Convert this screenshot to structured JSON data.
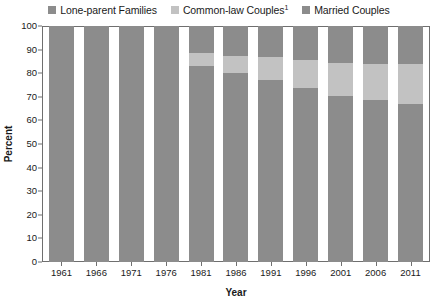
{
  "chart_data": {
    "type": "bar",
    "stacked": true,
    "title": "",
    "xlabel": "Year",
    "ylabel": "Percent",
    "ylim": [
      0,
      100
    ],
    "ytick_step": 10,
    "yticks": [
      "100",
      "90",
      "80",
      "70",
      "60",
      "50",
      "40",
      "30",
      "20",
      "10",
      "0"
    ],
    "grid": false,
    "legend_position": "top-center",
    "categories": [
      "1961",
      "1966",
      "1971",
      "1976",
      "1981",
      "1986",
      "1991",
      "1996",
      "2001",
      "2006",
      "2011"
    ],
    "series": [
      {
        "name": "Lone-parent Families",
        "color": "#8c8c8c",
        "values": [
          8.4,
          8.4,
          8.4,
          9.4,
          11.3,
          12.7,
          13.0,
          14.5,
          15.7,
          15.9,
          16.3
        ]
      },
      {
        "name": "Common-law Couples",
        "footnote": "1",
        "color": "#c2c2c2",
        "values": [
          0.0,
          0.0,
          0.0,
          0.0,
          5.6,
          7.2,
          9.9,
          11.8,
          13.8,
          15.5,
          16.7
        ]
      },
      {
        "name": "Married Couples",
        "color": "#8c8c8c",
        "values": [
          91.6,
          91.6,
          91.6,
          90.6,
          83.1,
          80.1,
          77.1,
          73.7,
          70.5,
          68.6,
          67.0
        ]
      }
    ]
  },
  "legend": {
    "items": [
      {
        "label": "Lone-parent Families",
        "footnote": "",
        "color": "#8c8c8c",
        "swatch_name": "legend-swatch-lone-parent"
      },
      {
        "label": "Common-law Couples",
        "footnote": "1",
        "color": "#c2c2c2",
        "swatch_name": "legend-swatch-common-law"
      },
      {
        "label": "Married Couples",
        "footnote": "",
        "color": "#8c8c8c",
        "swatch_name": "legend-swatch-married"
      }
    ]
  },
  "axes": {
    "y_title": "Percent",
    "x_title": "Year"
  },
  "colors": {
    "dark_gray": "#8c8c8c",
    "light_gray": "#c2c2c2",
    "axis_line": "#6f6f6f",
    "text": "#1a1a1a",
    "background": "#ffffff"
  }
}
